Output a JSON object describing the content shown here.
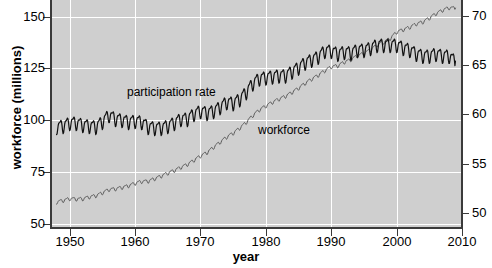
{
  "figure": {
    "width": 492,
    "height": 268,
    "panel_bg": "#cfcfcf",
    "grid_color": "#ffffff",
    "axis_color": "#3a3a3a"
  },
  "axes": {
    "x": {
      "title": "year",
      "ticks": [
        1950,
        1960,
        1970,
        1980,
        1990,
        2000,
        2010
      ],
      "tick_labels": [
        "1950",
        "1960",
        "1970",
        "1980",
        "1990",
        "2000",
        "2010"
      ],
      "min": 1947.0,
      "max": 2010.0
    },
    "y_left": {
      "title": "workforce (millions)",
      "ticks": [
        50,
        75,
        100,
        125,
        150
      ],
      "tick_labels": [
        "50",
        "75",
        "100",
        "125",
        "150"
      ],
      "min": 48.0,
      "max": 158.0
    },
    "y_right": {
      "title": "",
      "ticks": [
        50,
        55,
        60,
        65,
        70
      ],
      "tick_labels": [
        "50",
        "55",
        "60",
        "65",
        "70"
      ],
      "min": 48.5,
      "max": 71.6
    }
  },
  "annotations": [
    {
      "name": "participation-rate-label",
      "text": "participation rate"
    },
    {
      "name": "workforce-label",
      "text": "workforce"
    }
  ],
  "chart_data": {
    "type": "line",
    "title": "",
    "subtitle": "",
    "xlabel": "year",
    "ylabel": "workforce (millions)",
    "ylabel_right": "participation rate (percent)",
    "xlim": [
      1947.0,
      2010.0
    ],
    "ylim": [
      48.0,
      158.0
    ],
    "ylim_right": [
      48.5,
      71.6
    ],
    "grid": true,
    "legend": "inline-annotations",
    "series": [
      {
        "name": "workforce",
        "axis": "left",
        "unit": "millions",
        "color": "#5a5a5a",
        "linewidth": 1.0,
        "seasonal_amplitude": 1.1,
        "x": [
          1948,
          1949,
          1950,
          1951,
          1952,
          1953,
          1954,
          1955,
          1956,
          1957,
          1958,
          1959,
          1960,
          1961,
          1962,
          1963,
          1964,
          1965,
          1966,
          1967,
          1968,
          1969,
          1970,
          1971,
          1972,
          1973,
          1974,
          1975,
          1976,
          1977,
          1978,
          1979,
          1980,
          1981,
          1982,
          1983,
          1984,
          1985,
          1986,
          1987,
          1988,
          1989,
          1990,
          1991,
          1992,
          1993,
          1994,
          1995,
          1996,
          1997,
          1998,
          1999,
          2000,
          2001,
          2002,
          2003,
          2004,
          2005,
          2006,
          2007,
          2008,
          2009
        ],
        "values": [
          60.6,
          61.3,
          62.2,
          62.0,
          62.1,
          63.0,
          63.6,
          65.0,
          66.6,
          66.9,
          67.6,
          68.4,
          69.6,
          70.5,
          70.6,
          71.8,
          73.1,
          74.5,
          75.8,
          77.3,
          78.7,
          80.7,
          82.8,
          84.4,
          87.0,
          89.4,
          91.9,
          93.8,
          96.2,
          99.0,
          102.3,
          105.0,
          106.9,
          108.7,
          110.2,
          111.6,
          113.5,
          115.5,
          117.8,
          119.9,
          121.7,
          123.9,
          125.8,
          126.3,
          128.1,
          129.2,
          131.1,
          132.3,
          133.9,
          136.3,
          137.7,
          139.4,
          142.6,
          143.7,
          144.9,
          146.5,
          147.4,
          149.3,
          151.4,
          153.1,
          154.3,
          154.1
        ]
      },
      {
        "name": "participation rate",
        "axis": "right",
        "unit": "percent",
        "color": "#111111",
        "linewidth": 1.2,
        "seasonal_amplitude": 0.85,
        "x": [
          1948,
          1949,
          1950,
          1951,
          1952,
          1953,
          1954,
          1955,
          1956,
          1957,
          1958,
          1959,
          1960,
          1961,
          1962,
          1963,
          1964,
          1965,
          1966,
          1967,
          1968,
          1969,
          1970,
          1971,
          1972,
          1973,
          1974,
          1975,
          1976,
          1977,
          1978,
          1979,
          1980,
          1981,
          1982,
          1983,
          1984,
          1985,
          1986,
          1987,
          1988,
          1989,
          1990,
          1991,
          1992,
          1993,
          1994,
          1995,
          1996,
          1997,
          1998,
          1999,
          2000,
          2001,
          2002,
          2003,
          2004,
          2005,
          2006,
          2007,
          2008,
          2009
        ],
        "values": [
          58.8,
          58.9,
          59.2,
          59.2,
          59.0,
          58.9,
          58.8,
          59.3,
          60.0,
          59.6,
          59.5,
          59.3,
          59.4,
          59.3,
          58.8,
          58.7,
          58.7,
          58.9,
          59.2,
          59.6,
          59.6,
          60.1,
          60.4,
          60.2,
          60.4,
          60.8,
          61.3,
          61.2,
          61.6,
          62.3,
          63.2,
          63.7,
          63.8,
          63.9,
          64.0,
          64.0,
          64.4,
          64.8,
          65.3,
          65.6,
          65.9,
          66.5,
          66.5,
          66.2,
          66.4,
          66.3,
          66.6,
          66.6,
          66.8,
          67.1,
          67.1,
          67.1,
          67.1,
          66.8,
          66.6,
          66.2,
          66.0,
          66.0,
          66.2,
          66.0,
          66.0,
          65.4
        ]
      }
    ]
  }
}
